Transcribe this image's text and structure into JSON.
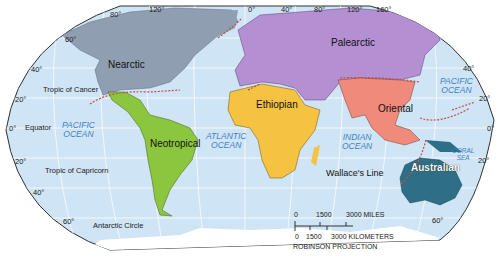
{
  "map": {
    "projection": "ROBINSON PROJECTION",
    "colors": {
      "ocean": "#cfe4f6",
      "nearctic": "#8f9fb1",
      "neotropical": "#8cc63f",
      "palearctic": "#b48fd1",
      "ethiopian": "#f5c242",
      "oriental": "#f08a7a",
      "australian": "#2f6f86",
      "boundary": "#c0504d",
      "antarctica": "#ffffff"
    },
    "regions": {
      "nearctic": "Nearctic",
      "neotropical": "Neotropical",
      "palearctic": "Palearctic",
      "ethiopian": "Ethiopian",
      "oriental": "Oriental",
      "australian": "Australian"
    },
    "oceans": {
      "pacific_west": [
        "PACIFIC",
        "OCEAN"
      ],
      "pacific_east": [
        "PACIFIC",
        "OCEAN"
      ],
      "atlantic": [
        "ATLANTIC",
        "OCEAN"
      ],
      "indian": [
        "INDIAN",
        "OCEAN"
      ],
      "coral_sea": [
        "CORAL",
        "SEA"
      ]
    },
    "lines": {
      "tropic_cancer": "Tropic of Cancer",
      "equator": "Equator",
      "tropic_capricorn": "Tropic of Capricorn",
      "antarctic_circle": "Antarctic Circle",
      "wallace": "Wallace's Line"
    },
    "longitude_labels": [
      "80°",
      "120°",
      "0°",
      "40°",
      "80°",
      "120°",
      "160°"
    ],
    "latitude_labels_left": [
      "60°",
      "40°",
      "20°",
      "0°",
      "20°",
      "40°",
      "60°"
    ],
    "latitude_labels_right": [
      "40°",
      "20°",
      "0°",
      "20°",
      "60°"
    ],
    "scale": {
      "miles_labels": [
        "0",
        "1500",
        "3000 MILES"
      ],
      "km_labels": [
        "0",
        "1500",
        "3000 KILOMETERS"
      ]
    }
  }
}
